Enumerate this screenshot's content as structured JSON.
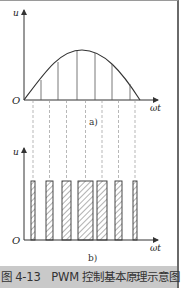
{
  "figure": {
    "caption": "图 4-13　PWM 控制基本原理示意图",
    "panel_a": {
      "label": "a)",
      "y_axis_label": "u",
      "x_axis_label": "ωt",
      "origin_label": "O",
      "description": "half sine wave divided into 7 equal segments"
    },
    "panel_b": {
      "label": "b)",
      "y_axis_label": "u",
      "x_axis_label": "ωt",
      "origin_label": "O",
      "description": "equal-amplitude PWM pulses with widths proportional to sine segment areas",
      "pulse_count": 7
    },
    "colors": {
      "line": "#333333",
      "dashed": "#888888",
      "caption_bg": "#c9c9c9"
    }
  }
}
